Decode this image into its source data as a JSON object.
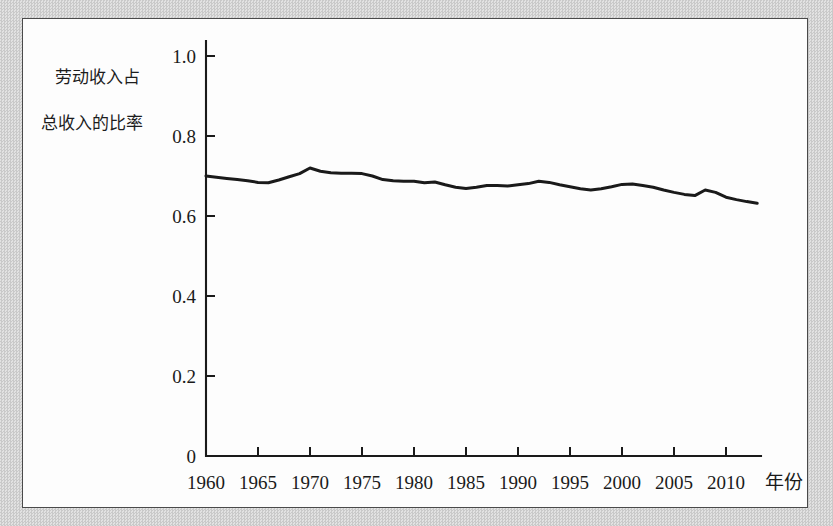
{
  "figure": {
    "y_axis_title_line1": "劳动收入占",
    "y_axis_title_line2": "总收入的比率",
    "x_axis_unit_label": "年份"
  },
  "chart_data": {
    "type": "line",
    "title": "",
    "subtitle": "",
    "xlabel": "年份",
    "ylabel": "劳动收入占总收入的比率",
    "xlim": [
      1960,
      2013
    ],
    "ylim": [
      0,
      1.0
    ],
    "grid": false,
    "legend": "none",
    "yticks": [
      "0",
      "0.2",
      "0.4",
      "0.6",
      "0.8",
      "1.0"
    ],
    "ytick_values": [
      0,
      0.2,
      0.4,
      0.6,
      0.8,
      1.0
    ],
    "xticks": [
      "1960",
      "1965",
      "1970",
      "1975",
      "1980",
      "1985",
      "1990",
      "1995",
      "2000",
      "2005",
      "2010"
    ],
    "xtick_values": [
      1960,
      1965,
      1970,
      1975,
      1980,
      1985,
      1990,
      1995,
      2000,
      2005,
      2010
    ],
    "series": [
      {
        "name": "劳动收入占总收入的比率",
        "color": "#1a1a1a",
        "x": [
          1960,
          1961,
          1962,
          1963,
          1964,
          1965,
          1966,
          1967,
          1968,
          1969,
          1970,
          1971,
          1972,
          1973,
          1974,
          1975,
          1976,
          1977,
          1978,
          1979,
          1980,
          1981,
          1982,
          1983,
          1984,
          1985,
          1986,
          1987,
          1988,
          1989,
          1990,
          1991,
          1992,
          1993,
          1994,
          1995,
          1996,
          1997,
          1998,
          1999,
          2000,
          2001,
          2002,
          2003,
          2004,
          2005,
          2006,
          2007,
          2008,
          2009,
          2010,
          2011,
          2012,
          2013
        ],
        "values": [
          0.7,
          0.697,
          0.694,
          0.691,
          0.688,
          0.684,
          0.683,
          0.69,
          0.698,
          0.706,
          0.72,
          0.712,
          0.708,
          0.707,
          0.707,
          0.706,
          0.7,
          0.691,
          0.688,
          0.687,
          0.687,
          0.683,
          0.685,
          0.678,
          0.672,
          0.669,
          0.672,
          0.676,
          0.676,
          0.675,
          0.678,
          0.681,
          0.687,
          0.684,
          0.678,
          0.673,
          0.668,
          0.665,
          0.668,
          0.673,
          0.679,
          0.68,
          0.676,
          0.672,
          0.665,
          0.659,
          0.654,
          0.651,
          0.665,
          0.659,
          0.647,
          0.641,
          0.636,
          0.632
        ]
      }
    ]
  }
}
